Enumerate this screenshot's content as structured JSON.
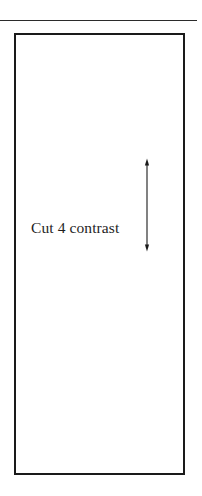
{
  "page": {
    "width": 202,
    "height": 496,
    "background_color": "#ffffff",
    "ink_color": "#1a1a1a"
  },
  "rule": {
    "name": "top-horizontal-rule",
    "color": "#2b2b2b"
  },
  "panel": {
    "name": "bordered-rectangle",
    "border_color": "#1a1a1a",
    "fill_color": "#ffffff"
  },
  "annotation": {
    "caption": "Cut 4 contrast",
    "arrow": {
      "type": "double-headed-vertical-arrow",
      "color": "#1a1a1a"
    }
  }
}
